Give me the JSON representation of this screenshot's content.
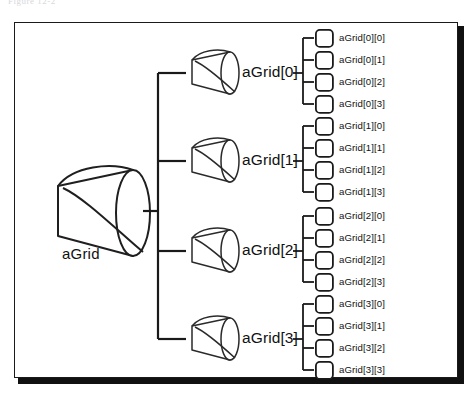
{
  "figure": {
    "clipped_header_text": "Figure 12-2",
    "root": {
      "label": "aGrid",
      "icon": "cone-shape"
    },
    "mid_nodes": [
      {
        "label": "aGrid[0]",
        "icon": "cone-shape"
      },
      {
        "label": "aGrid[1]",
        "icon": "cone-shape"
      },
      {
        "label": "aGrid[2]",
        "icon": "cone-shape"
      },
      {
        "label": "aGrid[3]",
        "icon": "cone-shape"
      }
    ],
    "leaf_groups": [
      {
        "parent": "aGrid[0]",
        "leaves": [
          {
            "label": "aGrid[0][0]",
            "icon": "rounded-square"
          },
          {
            "label": "aGrid[0][1]",
            "icon": "rounded-square"
          },
          {
            "label": "aGrid[0][2]",
            "icon": "rounded-square"
          },
          {
            "label": "aGrid[0][3]",
            "icon": "rounded-square"
          }
        ]
      },
      {
        "parent": "aGrid[1]",
        "leaves": [
          {
            "label": "aGrid[1][0]",
            "icon": "rounded-square"
          },
          {
            "label": "aGrid[1][1]",
            "icon": "rounded-square"
          },
          {
            "label": "aGrid[1][2]",
            "icon": "rounded-square"
          },
          {
            "label": "aGrid[1][3]",
            "icon": "rounded-square"
          }
        ]
      },
      {
        "parent": "aGrid[2]",
        "leaves": [
          {
            "label": "aGrid[2][0]",
            "icon": "rounded-square"
          },
          {
            "label": "aGrid[2][1]",
            "icon": "rounded-square"
          },
          {
            "label": "aGrid[2][2]",
            "icon": "rounded-square"
          },
          {
            "label": "aGrid[2][3]",
            "icon": "rounded-square"
          }
        ]
      },
      {
        "parent": "aGrid[3]",
        "leaves": [
          {
            "label": "aGrid[3][0]",
            "icon": "rounded-square"
          },
          {
            "label": "aGrid[3][1]",
            "icon": "rounded-square"
          },
          {
            "label": "aGrid[3][2]",
            "icon": "rounded-square"
          },
          {
            "label": "aGrid[3][3]",
            "icon": "rounded-square"
          }
        ]
      }
    ],
    "colors": {
      "ink": "#111111",
      "frame": "#1a1a1a",
      "background": "#ffffff",
      "shadow": "#111111"
    }
  }
}
